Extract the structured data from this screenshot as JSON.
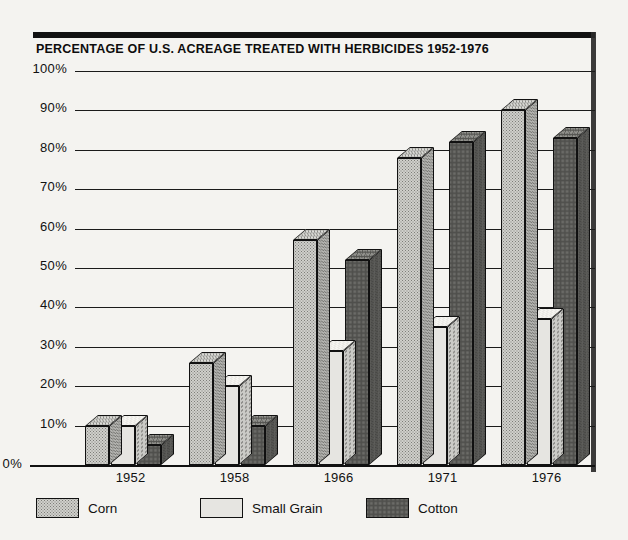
{
  "chart_data": {
    "type": "bar",
    "title": "PERCENTAGE OF U.S. ACREAGE TREATED WITH HERBICIDES 1952-1976",
    "xlabel": "",
    "ylabel": "",
    "ylim": [
      0,
      100
    ],
    "ytick_labels": [
      "0%",
      "10%",
      "20%",
      "30%",
      "40%",
      "50%",
      "60%",
      "70%",
      "80%",
      "90%",
      "100%"
    ],
    "ytick_values": [
      0,
      10,
      20,
      30,
      40,
      50,
      60,
      70,
      80,
      90,
      100
    ],
    "categories": [
      "1952",
      "1958",
      "1966",
      "1971",
      "1976"
    ],
    "grid": true,
    "legend_position": "bottom",
    "style": "3d-bar",
    "series": [
      {
        "name": "Corn",
        "values": [
          10,
          26,
          57,
          78,
          90
        ]
      },
      {
        "name": "Small Grain",
        "values": [
          10,
          20,
          29,
          35,
          37
        ]
      },
      {
        "name": "Cotton",
        "values": [
          5,
          10,
          52,
          82,
          83
        ]
      }
    ]
  },
  "legend": {
    "items": [
      {
        "label": "Corn",
        "pattern": "pat-corn",
        "color": "#cfcfcb"
      },
      {
        "label": "Small Grain",
        "pattern": "pat-grain",
        "color": "#e6e5e1"
      },
      {
        "label": "Cotton",
        "pattern": "pat-cotton",
        "color": "#a9a9a4"
      }
    ]
  },
  "colors": {
    "ink": "#111111",
    "paper": "#f4f3f0"
  }
}
